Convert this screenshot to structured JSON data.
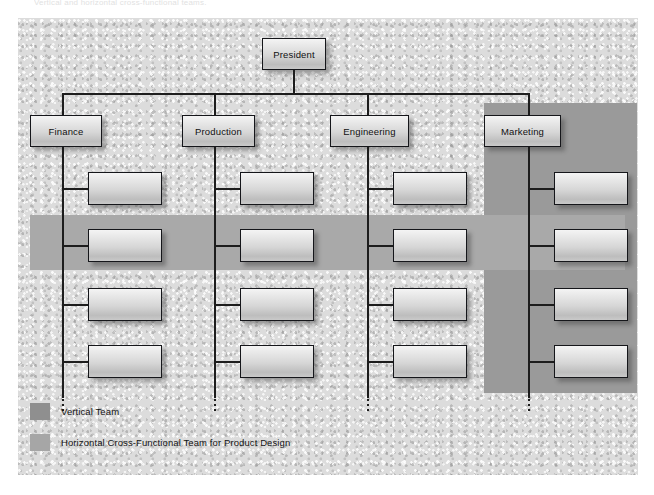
{
  "page": {
    "top_caption": "Vertical and horizontal cross-functional teams."
  },
  "chart": {
    "root": {
      "label": "President"
    },
    "departments": [
      {
        "id": "finance",
        "label": "Finance"
      },
      {
        "id": "production",
        "label": "Production"
      },
      {
        "id": "engineering",
        "label": "Engineering"
      },
      {
        "id": "marketing",
        "label": "Marketing"
      }
    ],
    "subordinates_per_department": 4,
    "subordinate_label": ""
  },
  "bands": {
    "vertical": {
      "name": "Vertical Team",
      "color": "#9a9a9a",
      "covers_department": "Marketing"
    },
    "horizontal": {
      "name": "Horizontal Cross-Functional Team for Product Design",
      "color": "#a9a9a9",
      "covers_row": 2
    }
  },
  "legend": {
    "items": [
      {
        "label": "Vertical Team",
        "color": "#8f8f8f"
      },
      {
        "label": "Horizontal Cross-Functional Team for Product Design",
        "color": "#a6a6a6"
      }
    ]
  },
  "colors": {
    "canvas": "#dcdcdc",
    "box_border": "#15161a",
    "line": "#1d1d1d",
    "page": "#ffffff"
  }
}
